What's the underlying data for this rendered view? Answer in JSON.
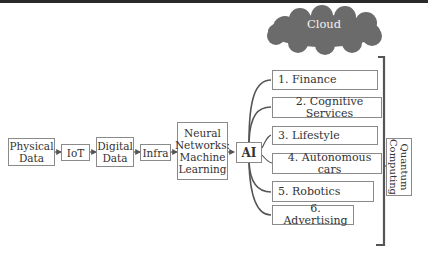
{
  "diagram": {
    "cloud": {
      "label": "Cloud",
      "fill": "#6b6b6b"
    },
    "pipeline": [
      {
        "id": "physical-data",
        "label": "Physical\nData"
      },
      {
        "id": "iot",
        "label": "IoT"
      },
      {
        "id": "digital-data",
        "label": "Digital\nData"
      },
      {
        "id": "infra",
        "label": "Infra"
      },
      {
        "id": "neural-networks",
        "label": "Neural\nNetworks:\nMachine\nLearning"
      },
      {
        "id": "ai",
        "label": "AI"
      }
    ],
    "pipeline_labels": {
      "physical_1": "Physical",
      "physical_2": "Data",
      "iot": "IoT",
      "digital_1": "Digital",
      "digital_2": "Data",
      "infra": "Infra",
      "nn_1": "Neural",
      "nn_2": "Networks:",
      "nn_3": "Machine",
      "nn_4": "Learning",
      "ai": "AI"
    },
    "applications": [
      {
        "label": "1. Finance"
      },
      {
        "label": "2. Cognitive Services"
      },
      {
        "label": "3. Lifestyle"
      },
      {
        "label": "4. Autonomous cars"
      },
      {
        "label": "5. Robotics"
      },
      {
        "label": "6. Advertising"
      }
    ],
    "quantum": {
      "line1": "Quantum",
      "line2": "Computing"
    },
    "colors": {
      "line": "#555555",
      "border": "#8a8a8a",
      "topbar": "#2a2a2a"
    }
  }
}
